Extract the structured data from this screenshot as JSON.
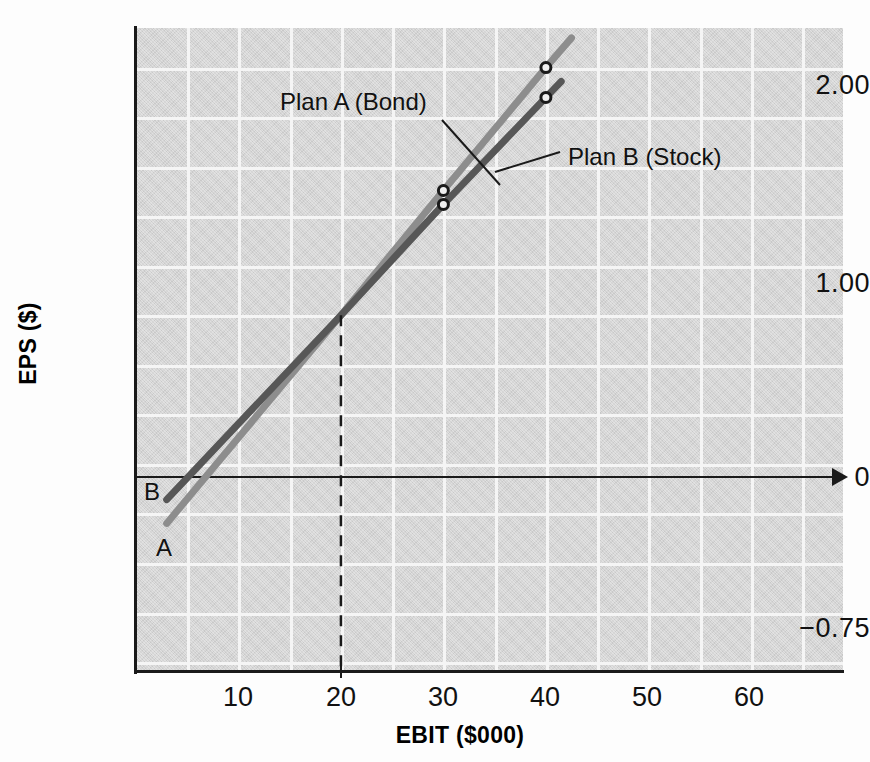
{
  "chart_data": {
    "type": "line",
    "title": "",
    "xlabel": "EBIT ($000)",
    "ylabel": "EPS ($)",
    "xlim": [
      0,
      69
    ],
    "ylim": [
      -1.05,
      2.2
    ],
    "xticks": [
      10,
      20,
      30,
      40,
      50,
      60
    ],
    "yticks": [
      "2.00",
      "1.00",
      "0",
      "-0.75"
    ],
    "ytick_values": [
      2.0,
      1.0,
      0.0,
      -0.75
    ],
    "grid": true,
    "grid_color": "#f5f5f5",
    "plot_background": "#d4d4d4",
    "legend": "inline-annotations",
    "series": [
      {
        "name": "Plan A (Bond)",
        "short_label": "A",
        "color": "#8d8d8d",
        "x": [
          3.0,
          20.0,
          30.0,
          40.0,
          42.5
        ],
        "y": [
          -0.3,
          0.75,
          1.38,
          2.0,
          2.15
        ],
        "markers": [
          {
            "x": 30,
            "y": 1.38
          },
          {
            "x": 40,
            "y": 2.0
          }
        ]
      },
      {
        "name": "Plan B (Stock)",
        "short_label": "B",
        "color": "#575757",
        "x": [
          3.0,
          20.0,
          30.0,
          40.0,
          41.5
        ],
        "y": [
          -0.18,
          0.75,
          1.31,
          1.85,
          1.93
        ],
        "markers": [
          {
            "x": 30,
            "y": 1.31
          },
          {
            "x": 40,
            "y": 1.85
          }
        ]
      }
    ],
    "indifference_point": {
      "x": 20,
      "y": 0.75,
      "dashed_guide": true,
      "dash_color": "#1a1a1a"
    },
    "annotations": [
      {
        "text": "Plan A (Bond)",
        "target_series": "Plan A (Bond)"
      },
      {
        "text": "Plan B (Stock)",
        "target_series": "Plan B (Stock)"
      }
    ]
  },
  "axis": {
    "y_title": "EPS ($)",
    "x_title": "EBIT ($000)",
    "y_ticks": [
      {
        "label": "2.00"
      },
      {
        "label": "1.00"
      },
      {
        "label": "0"
      },
      {
        "label": "−0.75"
      }
    ],
    "x_ticks": [
      {
        "label": "10"
      },
      {
        "label": "20"
      },
      {
        "label": "30"
      },
      {
        "label": "40"
      },
      {
        "label": "50"
      },
      {
        "label": "60"
      }
    ]
  },
  "labels": {
    "plan_a_note": "Plan A (Bond)",
    "plan_b_note": "Plan B (Stock)",
    "end_a": "A",
    "end_b": "B"
  }
}
